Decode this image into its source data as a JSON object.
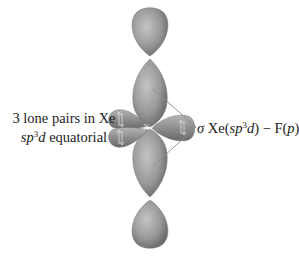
{
  "diagram": {
    "left_label": {
      "line1": "3 lone pairs in Xe",
      "line2_prefix": "sp",
      "line2_sup": "3",
      "line2_mid": "d",
      "line2_suffix": " equatorial"
    },
    "right_label": {
      "sigma": "σ",
      "text_a": " Xe(",
      "sp": "sp",
      "sup": "3",
      "d": "d",
      "text_b": ") − F(",
      "p": "p",
      "text_c": ")"
    },
    "center_atom": "Xe",
    "lone_pair_symbol": "⇅",
    "colors": {
      "lobe_fill": "#9a9a9a",
      "lobe_dark": "#6e6e6e",
      "lobe_light": "#bdbdbd",
      "line": "#808080",
      "text": "#222222"
    }
  }
}
